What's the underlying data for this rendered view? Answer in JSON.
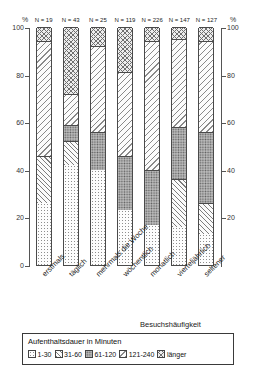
{
  "chart_data": {
    "type": "bar",
    "subtype": "stacked-100-percent",
    "title": "",
    "xlabel": "Besuchshäufigkeit",
    "ylabel": "%",
    "ylabel_right": "%",
    "ylim": [
      0,
      100
    ],
    "yticks": [
      0,
      20,
      40,
      60,
      80,
      100
    ],
    "ytick_labels": [
      "0",
      "20",
      "40",
      "60",
      "80",
      "100"
    ],
    "grid": false,
    "legend_title": "Aufenthaltsdauer in Minuten",
    "legend_position": "bottom",
    "categories": [
      "erstmals",
      "täglich",
      "mehrmals die Woche",
      "wöchentlich",
      "monatlich",
      "vierteljährlich",
      "seltener"
    ],
    "sample_sizes": [
      "N = 19",
      "N = 43",
      "N = 25",
      "N = 119",
      "N = 226",
      "N = 147",
      "N = 127"
    ],
    "sample_size_values": [
      19,
      43,
      25,
      119,
      226,
      147,
      127
    ],
    "series": [
      {
        "name": "1-30",
        "pattern": "dotted-fine",
        "values": [
          26,
          42,
          40,
          23,
          17,
          16,
          13
        ]
      },
      {
        "name": "31-60",
        "pattern": "diagonal-up",
        "values": [
          20,
          10,
          0,
          0,
          0,
          20,
          13
        ]
      },
      {
        "name": "61-120",
        "pattern": "dotted-dark",
        "values": [
          0,
          7,
          16,
          23,
          23,
          22,
          30
        ]
      },
      {
        "name": "121-240",
        "pattern": "diagonal-down",
        "values": [
          48,
          13,
          36,
          35,
          54,
          37,
          38
        ]
      },
      {
        "name": "länger",
        "pattern": "crosshatch",
        "values": [
          6,
          28,
          8,
          19,
          6,
          5,
          6
        ]
      }
    ]
  },
  "axes": {
    "left_unit": "%",
    "right_unit": "%"
  }
}
